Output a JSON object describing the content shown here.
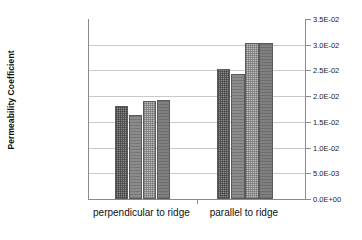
{
  "chart_data": {
    "type": "bar",
    "title": "",
    "xlabel": "",
    "ylabel": "Permeability Coefficient",
    "categories": [
      "perpendicular to ridge",
      "parallel to ridge"
    ],
    "series": [
      {
        "name": "series-1",
        "values": [
          0.018,
          0.0252
        ]
      },
      {
        "name": "series-2",
        "values": [
          0.0163,
          0.0243
        ]
      },
      {
        "name": "series-3",
        "values": [
          0.019,
          0.0303
        ]
      },
      {
        "name": "series-4",
        "values": [
          0.0192,
          0.0303
        ]
      }
    ],
    "ylim": [
      0,
      0.035
    ],
    "ytick_values": [
      0,
      0.005,
      0.01,
      0.015,
      0.02,
      0.025,
      0.03,
      0.035
    ],
    "ytick_labels": [
      "0.0E+00",
      "5.0E-03",
      "1.0E-02",
      "1.5E-02",
      "2.0E-02",
      "2.5E-02",
      "3.0E-02",
      "3.5E-02"
    ],
    "yaxis_position": "right",
    "grid": true,
    "legend": "none",
    "colors": {
      "series_1": "#8e8e8e",
      "series_2": "#8b8b8b",
      "series_3": "#bdbdbd",
      "series_4": "#7f7f7f",
      "gridline": "#c9c9c9",
      "axis": "#8a8a8a",
      "text": "#111111",
      "background": "#ffffff"
    }
  }
}
